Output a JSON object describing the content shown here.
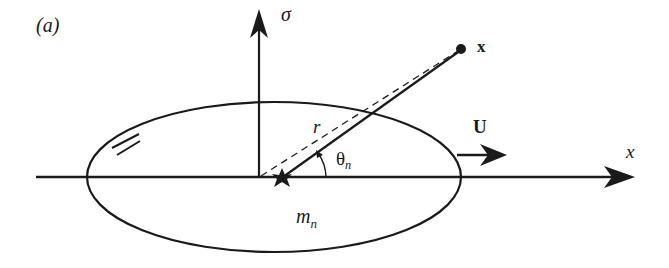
{
  "figure": {
    "panel_label": "(a)",
    "labels": {
      "sigma_axis": "σ",
      "x_axis": "x",
      "point": "x",
      "velocity": "U",
      "radius": "r",
      "angle_main": "θ",
      "angle_sub": "n",
      "mass_main": "m",
      "mass_sub": "n"
    },
    "colors": {
      "stroke": "#1a1a1a",
      "background": "#ffffff"
    }
  }
}
